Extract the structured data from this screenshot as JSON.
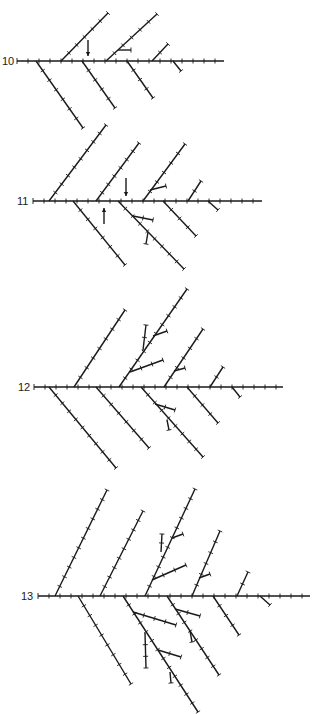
{
  "figure": {
    "stages": [
      {
        "label": "10",
        "label_pos": [
          2,
          56
        ],
        "axis": {
          "x1": 17,
          "x2": 224,
          "y": 61
        },
        "branches": [
          [
            61,
            61,
            108,
            13
          ],
          [
            106,
            61,
            157,
            14
          ],
          [
            152,
            61,
            168,
            44
          ],
          [
            36,
            61,
            83,
            128
          ],
          [
            82,
            61,
            115,
            108
          ],
          [
            127,
            61,
            153,
            98
          ],
          [
            173,
            61,
            181,
            71
          ],
          [
            118,
            50,
            131,
            50
          ]
        ],
        "arrows": [
          {
            "x": 88,
            "y1": 40,
            "y2": 56,
            "dir": "down"
          }
        ]
      },
      {
        "label": "11",
        "label_pos": [
          17,
          196
        ],
        "axis": {
          "x1": 33,
          "x2": 262,
          "y": 201
        },
        "branches": [
          [
            49,
            201,
            106,
            125
          ],
          [
            96,
            201,
            139,
            143
          ],
          [
            143,
            201,
            185,
            144
          ],
          [
            188,
            201,
            201,
            181
          ],
          [
            73,
            201,
            125,
            265
          ],
          [
            118,
            201,
            184,
            269
          ],
          [
            163,
            201,
            196,
            236
          ],
          [
            208,
            201,
            218,
            210
          ],
          [
            150,
            190,
            166,
            186
          ],
          [
            133,
            216,
            153,
            220
          ],
          [
            148,
            232,
            146,
            244
          ]
        ],
        "arrows": [
          {
            "x": 126,
            "y1": 178,
            "y2": 196,
            "dir": "down"
          },
          {
            "x": 104,
            "y1": 224,
            "y2": 208,
            "dir": "up"
          }
        ]
      },
      {
        "label": "12",
        "label_pos": [
          18,
          382
        ],
        "axis": {
          "x1": 34,
          "x2": 283,
          "y": 387
        },
        "branches": [
          [
            74,
            387,
            125,
            310
          ],
          [
            119,
            387,
            187,
            289
          ],
          [
            164,
            387,
            203,
            329
          ],
          [
            210,
            387,
            223,
            367
          ],
          [
            49,
            387,
            116,
            468
          ],
          [
            96,
            387,
            149,
            448
          ],
          [
            141,
            387,
            203,
            457
          ],
          [
            187,
            387,
            218,
            423
          ],
          [
            232,
            387,
            240,
            397
          ],
          [
            130,
            372,
            163,
            360
          ],
          [
            143,
            350,
            146,
            325
          ],
          [
            153,
            336,
            167,
            331
          ],
          [
            174,
            371,
            185,
            368
          ],
          [
            155,
            404,
            175,
            410
          ],
          [
            167,
            420,
            169,
            430
          ]
        ],
        "arrows": []
      },
      {
        "label": "13",
        "label_pos": [
          21,
          591
        ],
        "axis": {
          "x1": 38,
          "x2": 310,
          "y": 596
        },
        "branches": [
          [
            55,
            596,
            107,
            490
          ],
          [
            100,
            596,
            143,
            511
          ],
          [
            145,
            596,
            195,
            489
          ],
          [
            192,
            596,
            220,
            531
          ],
          [
            237,
            596,
            248,
            572
          ],
          [
            78,
            596,
            131,
            684
          ],
          [
            123,
            596,
            198,
            712
          ],
          [
            167,
            596,
            219,
            675
          ],
          [
            213,
            596,
            239,
            635
          ],
          [
            260,
            596,
            270,
            605
          ],
          [
            152,
            580,
            186,
            565
          ],
          [
            161,
            552,
            162,
            534
          ],
          [
            172,
            538,
            183,
            534
          ],
          [
            199,
            578,
            210,
            574
          ],
          [
            133,
            612,
            176,
            625
          ],
          [
            145,
            633,
            146,
            668
          ],
          [
            158,
            650,
            181,
            657
          ],
          [
            170,
            672,
            171,
            683
          ],
          [
            175,
            609,
            200,
            616
          ],
          [
            190,
            631,
            192,
            642
          ]
        ],
        "arrows": []
      }
    ],
    "colors": {
      "ink": "#1a1a1a",
      "background": "#ffffff"
    },
    "tick_spacing": 11
  }
}
